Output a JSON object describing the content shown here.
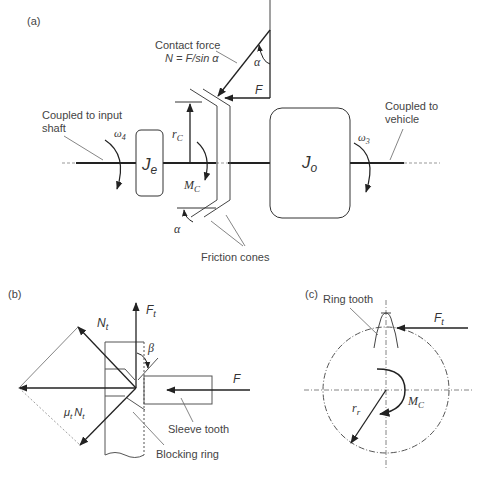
{
  "figure": {
    "panels": {
      "a": {
        "tag": "(a)",
        "contact_force_label": "Contact force",
        "contact_force_eq": "N = F/sin α",
        "input_label_1": "Coupled to input",
        "input_label_2": "shaft",
        "vehicle_label_1": "Coupled to",
        "vehicle_label_2": "vehicle",
        "friction_cones_label": "Friction cones",
        "je_symbol": "J",
        "je_sub": "e",
        "jo_symbol": "J",
        "jo_sub": "o",
        "omega4": "ω",
        "omega4_sub": "4",
        "omega3": "ω",
        "omega3_sub": "3",
        "rc": "r",
        "rc_sub": "C",
        "mc": "M",
        "mc_sub": "C",
        "alpha_top": "α",
        "alpha_bottom": "α",
        "force_F": "F"
      },
      "b": {
        "tag": "(b)",
        "Ft": "F",
        "Ft_sub": "t",
        "Nt": "N",
        "Nt_sub": "t",
        "mu_Nt_mu": "μ",
        "mu_Nt_mu_sub": "t",
        "mu_Nt_N": "N",
        "mu_Nt_N_sub": "t",
        "beta": "β",
        "force_F": "F",
        "sleeve_tooth_label": "Sleeve tooth",
        "blocking_ring_label": "Blocking ring"
      },
      "c": {
        "tag": "(c)",
        "ring_tooth_label": "Ring tooth",
        "Ft": "F",
        "Ft_sub": "t",
        "rr": "r",
        "rr_sub": "r",
        "mc": "M",
        "mc_sub": "C"
      }
    },
    "colors": {
      "line": "#333333",
      "thin_line": "#666666",
      "text": "#444444"
    }
  }
}
